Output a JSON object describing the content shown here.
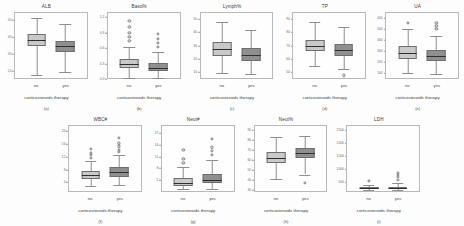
{
  "figure": {
    "group_labels": [
      "no",
      "yes"
    ],
    "x_axis_title": "corticosteroids therapy",
    "colors": {
      "no_box": "#c9c9c9",
      "yes_box": "#8f8f8f",
      "median": "#2e2e2e",
      "whisker": "#8e8e8e",
      "frame": "#b9b9b9"
    }
  },
  "chart_data": [
    {
      "type": "box",
      "title": "ALB",
      "panel_label": "(a)",
      "xlabel": "corticosteroids therapy",
      "ylabel": "",
      "categories": [
        "no",
        "yes"
      ],
      "yticks": [
        "50",
        "40",
        "30",
        "20"
      ],
      "ytick_values": [
        50,
        40,
        30,
        20
      ],
      "ylim": [
        15,
        55
      ],
      "grid": false,
      "legend": "none",
      "boxes": [
        {
          "group": "no",
          "min": 17.0,
          "q1": 35.0,
          "median": 38.5,
          "q3": 42.0,
          "max": 52.0,
          "outliers": []
        },
        {
          "group": "yes",
          "min": 19.0,
          "q1": 31.0,
          "median": 34.5,
          "q3": 38.0,
          "max": 48.0,
          "outliers": []
        }
      ]
    },
    {
      "type": "box",
      "title": "Baso%",
      "panel_label": "(b)",
      "xlabel": "corticosteroids therapy",
      "ylabel": "",
      "categories": [
        "no",
        "yes"
      ],
      "yticks": [
        "1.2",
        "0.9",
        "0.6",
        "0.3",
        "0.0"
      ],
      "ytick_values": [
        1.2,
        0.9,
        0.6,
        0.3,
        0.0
      ],
      "ylim": [
        0.0,
        1.3
      ],
      "grid": false,
      "legend": "none",
      "boxes": [
        {
          "group": "no",
          "min": 0.0,
          "q1": 0.2,
          "median": 0.28,
          "q3": 0.38,
          "max": 0.62,
          "outliers": [
            0.75,
            0.82,
            0.9,
            1.02,
            1.15
          ]
        },
        {
          "group": "yes",
          "min": 0.0,
          "q1": 0.14,
          "median": 0.21,
          "q3": 0.3,
          "max": 0.52,
          "outliers": [
            0.62,
            0.7,
            0.78,
            0.88
          ]
        }
      ]
    },
    {
      "type": "box",
      "title": "Lymph%",
      "panel_label": "(c)",
      "xlabel": "corticosteroids therapy",
      "ylabel": "",
      "categories": [
        "no",
        "yes"
      ],
      "yticks": [
        "50",
        "40",
        "30",
        "20",
        "10"
      ],
      "ytick_values": [
        50,
        40,
        30,
        20,
        10
      ],
      "ylim": [
        5,
        55
      ],
      "grid": false,
      "legend": "none",
      "boxes": [
        {
          "group": "no",
          "min": 9.0,
          "q1": 22.0,
          "median": 27.5,
          "q3": 33.0,
          "max": 48.0,
          "outliers": []
        },
        {
          "group": "yes",
          "min": 8.0,
          "q1": 18.0,
          "median": 23.0,
          "q3": 28.0,
          "max": 42.0,
          "outliers": []
        }
      ]
    },
    {
      "type": "box",
      "title": "TP",
      "panel_label": "(d)",
      "xlabel": "corticosteroids therapy",
      "ylabel": "",
      "categories": [
        "no",
        "yes"
      ],
      "yticks": [
        "90",
        "80",
        "70",
        "60",
        "50"
      ],
      "ytick_values": [
        90,
        80,
        70,
        60,
        50
      ],
      "ylim": [
        45,
        95
      ],
      "grid": false,
      "legend": "none",
      "boxes": [
        {
          "group": "no",
          "min": 54.0,
          "q1": 66.0,
          "median": 70.0,
          "q3": 74.0,
          "max": 88.0,
          "outliers": []
        },
        {
          "group": "yes",
          "min": 52.0,
          "q1": 62.0,
          "median": 66.5,
          "q3": 71.0,
          "max": 84.0,
          "outliers": [
            47.0
          ]
        }
      ]
    },
    {
      "type": "box",
      "title": "UA",
      "panel_label": "(e)",
      "xlabel": "corticosteroids therapy",
      "ylabel": "",
      "categories": [
        "no",
        "yes"
      ],
      "yticks": [
        "600",
        "500",
        "400",
        "300",
        "200",
        "100"
      ],
      "ytick_values": [
        600,
        500,
        400,
        300,
        200,
        100
      ],
      "ylim": [
        50,
        650
      ],
      "grid": false,
      "legend": "none",
      "boxes": [
        {
          "group": "no",
          "min": 95.0,
          "q1": 230.0,
          "median": 285.0,
          "q3": 350.0,
          "max": 500.0,
          "outliers": [
            560.0
          ]
        },
        {
          "group": "yes",
          "min": 90.0,
          "q1": 205.0,
          "median": 250.0,
          "q3": 305.0,
          "max": 440.0,
          "outliers": [
            500.0,
            530.0,
            555.0
          ]
        }
      ]
    },
    {
      "type": "box",
      "title": "WBC#",
      "panel_label": "(f)",
      "xlabel": "corticosteroids therapy",
      "ylabel": "",
      "categories": [
        "no",
        "yes"
      ],
      "yticks": [
        "20",
        "16",
        "12",
        "8",
        "4"
      ],
      "ytick_values": [
        20,
        16,
        12,
        8,
        4
      ],
      "ylim": [
        1,
        22
      ],
      "grid": false,
      "legend": "none",
      "boxes": [
        {
          "group": "no",
          "min": 2.6,
          "q1": 5.0,
          "median": 6.2,
          "q3": 7.6,
          "max": 10.8,
          "outliers": [
            11.8,
            12.6,
            13.4,
            14.6
          ]
        },
        {
          "group": "yes",
          "min": 2.8,
          "q1": 5.6,
          "median": 7.0,
          "q3": 8.6,
          "max": 12.6,
          "outliers": [
            13.6,
            14.4,
            15.4,
            16.4,
            18.2
          ]
        }
      ]
    },
    {
      "type": "box",
      "title": "Neut#",
      "panel_label": "(g)",
      "xlabel": "corticosteroids therapy",
      "ylabel": "",
      "categories": [
        "no",
        "yes"
      ],
      "yticks": [
        "17",
        "14",
        "11",
        "8",
        "5"
      ],
      "ytick_values": [
        17,
        14,
        11,
        8,
        5
      ],
      "ylim": [
        2,
        19
      ],
      "grid": false,
      "legend": "none",
      "boxes": [
        {
          "group": "no",
          "min": 2.4,
          "q1": 3.4,
          "median": 4.2,
          "q3": 5.4,
          "max": 8.2,
          "outliers": [
            9.4,
            10.4,
            12.8
          ]
        },
        {
          "group": "yes",
          "min": 2.6,
          "q1": 4.0,
          "median": 5.0,
          "q3": 6.4,
          "max": 10.2,
          "outliers": [
            11.4,
            12.4,
            13.4,
            15.6
          ]
        }
      ]
    },
    {
      "type": "box",
      "title": "Neut%",
      "panel_label": "(h)",
      "xlabel": "corticosteroids therapy",
      "ylabel": "",
      "categories": [
        "no",
        "yes"
      ],
      "yticks": [
        "90",
        "80",
        "70",
        "60",
        "50",
        "40",
        "30"
      ],
      "ytick_values": [
        90,
        80,
        70,
        60,
        50,
        40,
        30
      ],
      "ylim": [
        28,
        95
      ],
      "grid": false,
      "legend": "none",
      "boxes": [
        {
          "group": "no",
          "min": 40.0,
          "q1": 57.0,
          "median": 62.0,
          "q3": 68.0,
          "max": 84.0,
          "outliers": []
        },
        {
          "group": "yes",
          "min": 45.0,
          "q1": 62.0,
          "median": 67.0,
          "q3": 72.0,
          "max": 85.0,
          "outliers": [
            36.0
          ]
        }
      ]
    },
    {
      "type": "box",
      "title": "LDH",
      "panel_label": "(i)",
      "xlabel": "corticosteroids therapy",
      "ylabel": "",
      "categories": [
        "no",
        "yes"
      ],
      "yticks": [
        "2500",
        "2000",
        "1500",
        "1000",
        "500"
      ],
      "ytick_values": [
        2500,
        2000,
        1500,
        1000,
        500
      ],
      "ylim": [
        100,
        2700
      ],
      "grid": false,
      "legend": "none",
      "boxes": [
        {
          "group": "no",
          "min": 130.0,
          "q1": 175.0,
          "median": 205.0,
          "q3": 245.0,
          "max": 340.0,
          "outliers": [
            520.0
          ]
        },
        {
          "group": "yes",
          "min": 135.0,
          "q1": 185.0,
          "median": 225.0,
          "q3": 275.0,
          "max": 420.0,
          "outliers": [
            560.0,
            660.0,
            740.0,
            830.0
          ]
        }
      ]
    }
  ]
}
